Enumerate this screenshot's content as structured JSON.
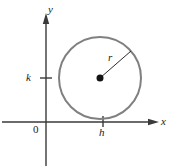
{
  "figure": {
    "background_color": "#ffffff",
    "axis_color": "#3a3a3a",
    "circle_color": "#808080",
    "label_color": "#1a1a1a"
  },
  "axes": {
    "y_axis_label": "y",
    "x_axis_label": "x",
    "origin_label": "0",
    "x_axis_y_px": 122,
    "y_axis_x_px": 46,
    "x_axis_start_px": 2,
    "x_axis_end_px": 158,
    "y_axis_start_px": 14,
    "y_axis_end_px": 166
  },
  "ticks": [
    {
      "name": "k-tick",
      "label": "k",
      "axis": "y",
      "position_px": 78,
      "tick_from_px": 40,
      "tick_to_px": 52
    },
    {
      "name": "h-tick",
      "label": "h",
      "axis": "x",
      "position_px": 103,
      "tick_from_px": 116,
      "tick_to_px": 127
    }
  ],
  "circle": {
    "center_x_px": 100,
    "center_y_px": 78,
    "radius_px": 41,
    "stroke_width_px": 2,
    "stroke_color": "#808080"
  },
  "center_point": {
    "label": "center-dot",
    "radius_px": 3.5,
    "color": "#141414"
  },
  "radius_segment": {
    "label": "r",
    "from_x_px": 100,
    "from_y_px": 78,
    "to_x_px": 131,
    "to_y_px": 51,
    "color": "#2b2b2b",
    "stroke_width_px": 1
  },
  "chart_data": {
    "type": "scatter",
    "xlabel": "x",
    "ylabel": "y",
    "annotations": [
      "0",
      "h",
      "k",
      "r",
      "x",
      "y"
    ],
    "shapes": [
      {
        "kind": "circle",
        "center": [
          "h",
          "k"
        ],
        "radius": "r",
        "stroke": "#808080"
      },
      {
        "kind": "point",
        "at": [
          "h",
          "k"
        ],
        "label": "center"
      },
      {
        "kind": "segment",
        "from": [
          "h",
          "k"
        ],
        "to": "point-on-circle",
        "label": "r"
      }
    ],
    "grid": false,
    "legend": "none"
  }
}
